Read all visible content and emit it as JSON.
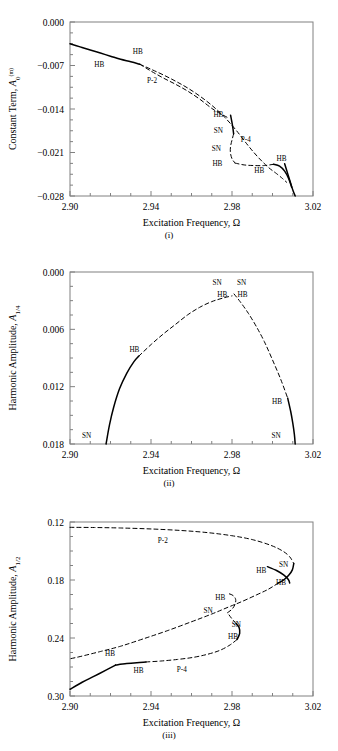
{
  "figure": {
    "type": "multi-panel-bifurcation-diagram",
    "panel_count": 3,
    "line_color": "#000000",
    "frame_color": "#808080",
    "background": "#ffffff"
  },
  "panels": [
    {
      "caption": "(i)",
      "ylabel_main": "Constant Term,",
      "ylabel_sym": "A",
      "ylabel_sub": "0",
      "ylabel_sup": "(m)",
      "xlabel_main": "Excitation Frequency,",
      "xlabel_sym": "Ω",
      "xticks": [
        "2.90",
        "2.94",
        "2.98",
        "3.02"
      ],
      "yticks": [
        "0.000",
        "−0.007",
        "−0.014",
        "−0.021",
        "−0.028"
      ],
      "annotations": [
        {
          "text": "HB",
          "x": 2.9145,
          "y": -0.0072
        },
        {
          "text": "HB",
          "x": 2.9335,
          "y": -0.0052
        },
        {
          "text": "P-2",
          "x": 2.9405,
          "y": -0.0098
        },
        {
          "text": "HB",
          "x": 2.9733,
          "y": -0.0153
        },
        {
          "text": "SN",
          "x": 2.9733,
          "y": -0.0178
        },
        {
          "text": "P-4",
          "x": 2.9868,
          "y": -0.0193
        },
        {
          "text": "SN",
          "x": 2.9723,
          "y": -0.0208
        },
        {
          "text": "HB",
          "x": 2.9728,
          "y": -0.0232
        },
        {
          "text": "HB",
          "x": 2.9935,
          "y": -0.0243
        },
        {
          "text": "HB",
          "x": 3.0045,
          "y": -0.0224
        }
      ]
    },
    {
      "caption": "(ii)",
      "ylabel_main": "Harmonic Amplitude,",
      "ylabel_sym": "A",
      "ylabel_sub": "1/4",
      "ylabel_sup": "",
      "xlabel_main": "Excitation Frequency,",
      "xlabel_sym": "Ω",
      "xticks": [
        "2.90",
        "2.94",
        "2.98",
        "3.02"
      ],
      "yticks": [
        "0.018",
        "0.012",
        "0.006",
        "0.000"
      ],
      "annotations": [
        {
          "text": "SN",
          "x": 2.9727,
          "y": 0.01665
        },
        {
          "text": "SN",
          "x": 2.9848,
          "y": 0.01665
        },
        {
          "text": "HB",
          "x": 2.9752,
          "y": 0.01543
        },
        {
          "text": "HB",
          "x": 2.9852,
          "y": 0.01543
        },
        {
          "text": "HB",
          "x": 2.9318,
          "y": 0.00968
        },
        {
          "text": "HB",
          "x": 3.0022,
          "y": 0.00418
        },
        {
          "text": "SN",
          "x": 2.9082,
          "y": 0.00068
        },
        {
          "text": "SN",
          "x": 3.0018,
          "y": 0.00068
        }
      ]
    },
    {
      "caption": "(iii)",
      "ylabel_main": "Harmonic Amplitude,",
      "ylabel_sym": "A",
      "ylabel_sub": "1/2",
      "ylabel_sup": "",
      "xlabel_main": "Excitation Frequency,",
      "xlabel_sym": "Ω",
      "xticks": [
        "2.90",
        "2.94",
        "2.98",
        "3.02"
      ],
      "yticks": [
        "0.30",
        "0.24",
        "0.18",
        "0.12"
      ],
      "annotations": [
        {
          "text": "P-2",
          "x": 2.9458,
          "y": 0.2782
        },
        {
          "text": "SN",
          "x": 3.0055,
          "y": 0.2538
        },
        {
          "text": "HB",
          "x": 2.9945,
          "y": 0.2475
        },
        {
          "text": "HB",
          "x": 3.0042,
          "y": 0.2352
        },
        {
          "text": "HB",
          "x": 2.9742,
          "y": 0.2188
        },
        {
          "text": "SN",
          "x": 2.9682,
          "y": 0.2058
        },
        {
          "text": "SN",
          "x": 2.9822,
          "y": 0.1912
        },
        {
          "text": "HB",
          "x": 2.9805,
          "y": 0.1792
        },
        {
          "text": "HB",
          "x": 2.9198,
          "y": 0.1612
        },
        {
          "text": "HB",
          "x": 2.9338,
          "y": 0.1438
        },
        {
          "text": "P-4",
          "x": 2.9552,
          "y": 0.1452
        }
      ]
    }
  ],
  "chart_data": [
    {
      "panel": "(i)",
      "type": "line",
      "title": "",
      "xlabel": "Excitation Frequency, Ω",
      "ylabel": "Constant Term, A_0^(m)",
      "xlim": [
        2.9,
        3.02
      ],
      "ylim": [
        -0.028,
        0.0
      ],
      "xticks": [
        2.9,
        2.94,
        2.98,
        3.02
      ],
      "yticks": [
        0.0,
        -0.007,
        -0.014,
        -0.021,
        -0.028
      ],
      "grid": false,
      "legend": "none",
      "series": [
        {
          "name": "P-1 stable (solid, left)",
          "style": "solid",
          "x": [
            2.9,
            2.905,
            2.91,
            2.915,
            2.92,
            2.925,
            2.93,
            2.9345
          ],
          "y": [
            -0.0035,
            -0.004,
            -0.0045,
            -0.005,
            -0.0055,
            -0.006,
            -0.0064,
            -0.0068
          ]
        },
        {
          "name": "P-1 unstable (dashed, main backbone)",
          "style": "dashed",
          "x": [
            2.9345,
            2.94,
            2.946,
            2.952,
            2.958,
            2.964,
            2.97,
            2.976,
            2.982,
            2.988,
            2.993,
            2.998,
            3.002,
            3.005,
            3.007
          ],
          "y": [
            -0.0068,
            -0.0076,
            -0.0085,
            -0.0095,
            -0.0106,
            -0.0119,
            -0.0134,
            -0.0152,
            -0.0174,
            -0.0199,
            -0.0218,
            -0.0234,
            -0.0244,
            -0.0252,
            -0.0258
          ]
        },
        {
          "name": "P-1 stable (solid, right descending)",
          "style": "solid",
          "x": [
            3.006,
            3.0075,
            3.009,
            3.0102,
            3.0112
          ],
          "y": [
            -0.0228,
            -0.0244,
            -0.026,
            -0.0272,
            -0.028
          ]
        },
        {
          "name": "P-2 branch (dashed, upper secondary)",
          "style": "dashed",
          "x": [
            2.9345,
            2.94,
            2.946,
            2.952,
            2.958,
            2.964,
            2.97,
            2.974,
            2.978
          ],
          "y": [
            -0.0068,
            -0.0079,
            -0.009,
            -0.01,
            -0.0111,
            -0.0124,
            -0.0139,
            -0.0147,
            -0.0154
          ]
        },
        {
          "name": "P-4 solid upper-left segment",
          "style": "solid",
          "x": [
            2.9793,
            2.98,
            2.9805,
            2.9808
          ],
          "y": [
            -0.015,
            -0.0162,
            -0.0172,
            -0.018
          ]
        },
        {
          "name": "P-4 dashed left vertical",
          "style": "dashed",
          "x": [
            2.9808,
            2.98,
            2.9793,
            2.9792,
            2.98,
            2.9815
          ],
          "y": [
            -0.018,
            -0.019,
            -0.02,
            -0.021,
            -0.022,
            -0.0227
          ]
        },
        {
          "name": "P-4 dashed bottom horizontal",
          "style": "dashed",
          "x": [
            2.9815,
            2.986,
            2.991,
            2.996,
            3.0005
          ],
          "y": [
            -0.0227,
            -0.023,
            -0.0231,
            -0.0231,
            -0.0229
          ]
        },
        {
          "name": "P-4 solid right lower",
          "style": "solid",
          "x": [
            3.0005,
            3.0035,
            3.006,
            3.008,
            3.0095
          ],
          "y": [
            -0.0229,
            -0.0232,
            -0.024,
            -0.0252,
            -0.0266
          ]
        }
      ],
      "annotation_labels": [
        "HB",
        "HB",
        "P-2",
        "HB",
        "SN",
        "P-4",
        "SN",
        "HB",
        "HB",
        "HB"
      ]
    },
    {
      "panel": "(ii)",
      "type": "line",
      "title": "",
      "xlabel": "Excitation Frequency, Ω",
      "ylabel": "Harmonic Amplitude, A_1/4",
      "xlim": [
        2.9,
        3.02
      ],
      "ylim": [
        0.0,
        0.018
      ],
      "xticks": [
        2.9,
        2.94,
        2.98,
        3.02
      ],
      "yticks": [
        0.0,
        0.006,
        0.012,
        0.018
      ],
      "grid": false,
      "legend": "none",
      "series": [
        {
          "name": "left stable branch (solid)",
          "style": "solid",
          "x": [
            2.9178,
            2.9195,
            2.9215,
            2.9245,
            2.928,
            2.9315,
            2.934
          ],
          "y": [
            0.0,
            0.002,
            0.0038,
            0.0058,
            0.0074,
            0.0086,
            0.0092
          ]
        },
        {
          "name": "unstable arch (dashed)",
          "style": "dashed",
          "x": [
            2.934,
            2.94,
            2.946,
            2.952,
            2.958,
            2.964,
            2.97,
            2.976,
            2.98
          ],
          "y": [
            0.0092,
            0.0104,
            0.0115,
            0.0125,
            0.0135,
            0.0143,
            0.0149,
            0.0153,
            0.0155
          ]
        },
        {
          "name": "cusp right descent (dashed)",
          "style": "dashed",
          "x": [
            2.981,
            2.984,
            2.988,
            2.992,
            2.996,
            3.0,
            3.004,
            3.0075
          ],
          "y": [
            0.0157,
            0.0149,
            0.0137,
            0.0123,
            0.0107,
            0.0088,
            0.0068,
            0.0048
          ]
        },
        {
          "name": "right stable branch (solid)",
          "style": "solid",
          "x": [
            3.0075,
            3.009,
            3.01,
            3.0108,
            3.0112
          ],
          "y": [
            0.0048,
            0.0034,
            0.0022,
            0.001,
            0.0
          ]
        }
      ],
      "annotation_labels": [
        "SN",
        "SN",
        "HB",
        "HB",
        "HB",
        "HB",
        "SN",
        "SN"
      ]
    },
    {
      "panel": "(iii)",
      "type": "line",
      "title": "",
      "xlabel": "Excitation Frequency, Ω",
      "ylabel": "Harmonic Amplitude, A_1/2",
      "xlim": [
        2.9,
        3.02
      ],
      "ylim": [
        0.12,
        0.3
      ],
      "xticks": [
        2.9,
        2.94,
        2.98,
        3.02
      ],
      "yticks": [
        0.12,
        0.18,
        0.24,
        0.3
      ],
      "grid": false,
      "legend": "none",
      "series": [
        {
          "name": "P-2 upper branch (dashed)",
          "style": "dashed",
          "x": [
            2.9,
            2.912,
            2.925,
            2.94,
            2.955,
            2.968,
            2.98,
            2.99,
            2.999,
            3.005,
            3.0085,
            3.0105
          ],
          "y": [
            0.2945,
            0.2943,
            0.2938,
            0.2928,
            0.2912,
            0.289,
            0.2858,
            0.2818,
            0.276,
            0.27,
            0.264,
            0.257
          ]
        },
        {
          "name": "P-2 turning to lower (dashed/solid fold)",
          "style": "solid",
          "x": [
            3.0105,
            3.0098,
            3.008,
            3.0055,
            3.0028
          ],
          "y": [
            0.257,
            0.2505,
            0.2448,
            0.24,
            0.2368
          ]
        },
        {
          "name": "P-2 lower descending branch (dashed)",
          "style": "dashed",
          "x": [
            3.0028,
            2.998,
            2.992,
            2.985,
            2.978,
            2.97,
            2.96,
            2.948,
            2.936,
            2.925,
            2.915,
            2.905,
            2.9
          ],
          "y": [
            0.2368,
            0.2305,
            0.2245,
            0.2178,
            0.2118,
            0.2048,
            0.1968,
            0.1875,
            0.179,
            0.1715,
            0.166,
            0.1608,
            0.1585
          ]
        },
        {
          "name": "P-1 stable lower (solid)",
          "style": "solid",
          "x": [
            2.9,
            2.906,
            2.912,
            2.918,
            2.9225
          ],
          "y": [
            0.127,
            0.1342,
            0.1405,
            0.147,
            0.152
          ]
        },
        {
          "name": "P-1 stable shallow (solid)",
          "style": "solid",
          "x": [
            2.9225,
            2.928,
            2.933,
            2.9375
          ],
          "y": [
            0.152,
            0.1535,
            0.1545,
            0.1552
          ]
        },
        {
          "name": "P-4 lower branch (dashed)",
          "style": "dashed",
          "x": [
            2.9375,
            2.945,
            2.953,
            2.961,
            2.968,
            2.974,
            2.979,
            2.9825
          ],
          "y": [
            0.1552,
            0.1562,
            0.1578,
            0.16,
            0.1632,
            0.1672,
            0.1728,
            0.1785
          ]
        },
        {
          "name": "P-4 fold solid (lower SN)",
          "style": "solid",
          "x": [
            2.9825,
            2.9838,
            2.9835,
            2.982
          ],
          "y": [
            0.1785,
            0.1848,
            0.1908,
            0.195
          ]
        },
        {
          "name": "P-4 upper dashed to crossing",
          "style": "dashed",
          "x": [
            2.982,
            2.98,
            2.9785,
            2.9778
          ],
          "y": [
            0.195,
            0.1998,
            0.204,
            0.2062
          ]
        },
        {
          "name": "P-4 upper fold right (dashed/solid)",
          "style": "dashed",
          "x": [
            2.9778,
            2.98,
            2.9815,
            2.9818,
            2.9805,
            2.9785
          ],
          "y": [
            0.2062,
            0.2098,
            0.2148,
            0.22,
            0.224,
            0.2258
          ]
        },
        {
          "name": "upper right solid stable (HB-SN)",
          "style": "solid",
          "x": [
            2.9975,
            3.002,
            3.0055,
            3.0078,
            3.0085
          ],
          "y": [
            0.2538,
            0.2498,
            0.2452,
            0.2405,
            0.2368
          ]
        }
      ],
      "annotation_labels": [
        "P-2",
        "SN",
        "HB",
        "HB",
        "HB",
        "SN",
        "SN",
        "HB",
        "HB",
        "HB",
        "P-4"
      ]
    }
  ]
}
